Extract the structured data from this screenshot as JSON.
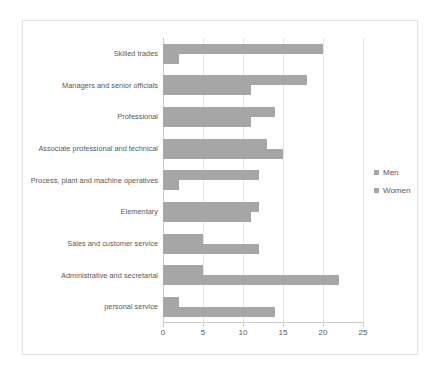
{
  "chart_data": {
    "type": "bar",
    "orientation": "horizontal",
    "title": "",
    "xlabel": "",
    "ylabel": "",
    "xlim": [
      0,
      25
    ],
    "xticks": [
      0,
      5,
      10,
      15,
      20,
      25
    ],
    "grid": true,
    "legend_position": "right",
    "categories": [
      "Skilled trades",
      "Managers and senior officials",
      "Professional",
      "Associate professional and technical",
      "Process, plant and machine operatives",
      "Elementary",
      "Sales and customer service",
      "Administrative and secretarial",
      "personal service"
    ],
    "series": [
      {
        "name": "Men",
        "color": "#A6A6A6",
        "values": [
          20,
          18,
          14,
          13,
          12,
          12,
          5,
          5,
          2
        ]
      },
      {
        "name": "Women",
        "color": "#A6A6A6",
        "values": [
          2,
          11,
          11,
          15,
          2,
          11,
          12,
          22,
          14
        ]
      }
    ]
  },
  "legend": {
    "items": [
      {
        "label": "Men"
      },
      {
        "label": "Women"
      }
    ]
  },
  "colors": {
    "bar": "#A6A6A6",
    "grid": "#E6E6E6",
    "axis": "#C9C9C9",
    "frame": "#E2E2E2",
    "text": "#595959"
  }
}
